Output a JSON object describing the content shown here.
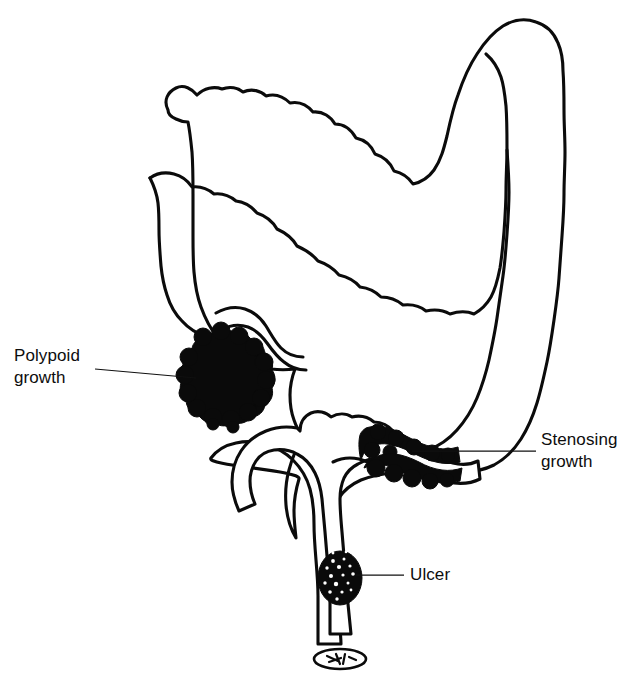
{
  "figure": {
    "title": "Large bowel (colon) diagram showing sites of carcinoma",
    "background_color": "#ffffff",
    "ink_color": "#0b0b0b"
  },
  "labels": [
    {
      "id": "polypoid-growth",
      "line1": "Polypoid",
      "line2": "growth",
      "text_x": 14,
      "text_y": 361,
      "leader": {
        "x1": 95,
        "y1": 369,
        "x2": 196,
        "y2": 378
      }
    },
    {
      "id": "stenosing-growth",
      "line1": "Stenosing",
      "line2": "growth",
      "text_x": 541,
      "text_y": 445,
      "leader": {
        "x1": 536,
        "y1": 451,
        "x2": 412,
        "y2": 451
      }
    },
    {
      "id": "ulcer",
      "line1": "Ulcer",
      "line2": "",
      "text_x": 410,
      "text_y": 580,
      "leader": {
        "x1": 404,
        "y1": 575,
        "x2": 356,
        "y2": 575
      }
    }
  ],
  "anatomy": {
    "parts": [
      "cecum",
      "ascending-colon",
      "hepatic-flexure",
      "transverse-colon",
      "splenic-flexure",
      "descending-colon",
      "sigmoid-colon",
      "rectum",
      "anal-canal",
      "terminal-ileum",
      "appendix"
    ]
  },
  "lesions": [
    {
      "id": "polypoid-growth-mass",
      "site": "cecum",
      "appearance": "lobulated cauliflower mass"
    },
    {
      "id": "stenosing-growth-upper-mass",
      "site": "sigmoid-colon",
      "appearance": "annular constricting mass"
    },
    {
      "id": "stenosing-growth-lower-mass",
      "site": "sigmoid-colon",
      "appearance": "annular constricting mass"
    },
    {
      "id": "ulcer-mass",
      "site": "rectum",
      "appearance": "ulcerated crater"
    }
  ]
}
